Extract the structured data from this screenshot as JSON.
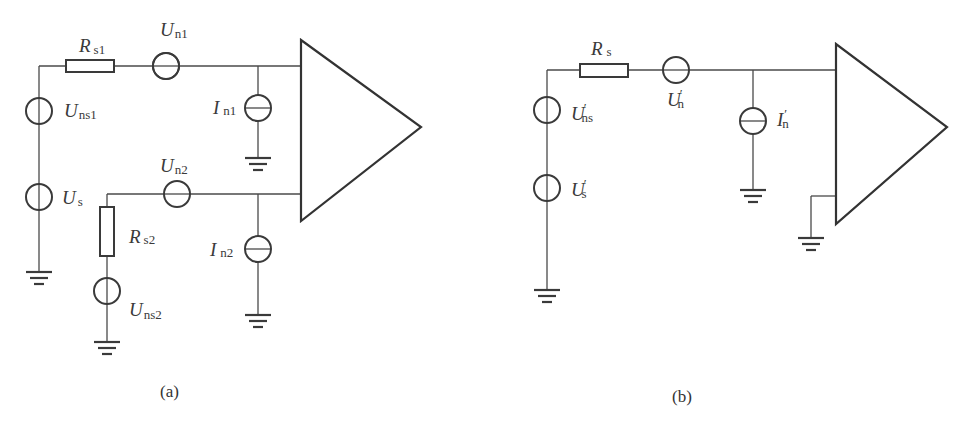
{
  "panel_a": {
    "caption": "(a)",
    "labels": {
      "rs1": {
        "main": "R",
        "sub": "s1"
      },
      "un1": {
        "main": "U",
        "sub": "n1"
      },
      "uns1": {
        "main": "U",
        "sub": "ns1"
      },
      "in1": {
        "main": "I",
        "sub": "n1"
      },
      "un2": {
        "main": "U",
        "sub": "n2"
      },
      "us": {
        "main": "U",
        "sub": "s"
      },
      "rs2": {
        "main": "R",
        "sub": "s2"
      },
      "in2": {
        "main": "I",
        "sub": "n2"
      },
      "uns2": {
        "main": "U",
        "sub": "ns2"
      }
    }
  },
  "panel_b": {
    "caption": "(b)",
    "labels": {
      "rs": {
        "main": "R",
        "sub": "s"
      },
      "un": {
        "main": "U",
        "prime": "′",
        "sub": "n"
      },
      "uns": {
        "main": "U",
        "prime": "′",
        "sub": "ns"
      },
      "in": {
        "main": "I",
        "prime": "′",
        "sub": "n"
      },
      "us": {
        "main": "U",
        "prime": "′",
        "sub": "s"
      }
    }
  }
}
